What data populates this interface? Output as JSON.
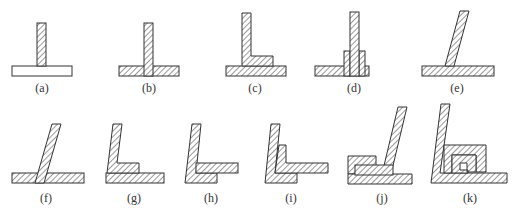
{
  "figure": {
    "hatch_color": "#333333",
    "background": "#ffffff",
    "panels": [
      {
        "id": "a",
        "label": "(a)"
      },
      {
        "id": "b",
        "label": "(b)"
      },
      {
        "id": "c",
        "label": "(c)"
      },
      {
        "id": "d",
        "label": "(d)"
      },
      {
        "id": "e",
        "label": "(e)"
      },
      {
        "id": "f",
        "label": "(f)"
      },
      {
        "id": "g",
        "label": "(g)"
      },
      {
        "id": "h",
        "label": "(h)"
      },
      {
        "id": "i",
        "label": "(i)"
      },
      {
        "id": "j",
        "label": "(j)"
      },
      {
        "id": "k",
        "label": "(k)"
      }
    ]
  }
}
